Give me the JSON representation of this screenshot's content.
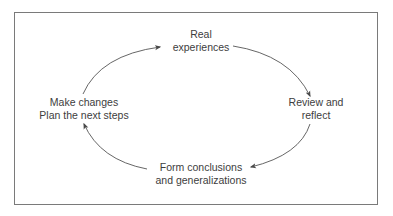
{
  "diagram": {
    "type": "cycle",
    "nodes": [
      {
        "id": "top",
        "lines": [
          "Real",
          "experiences"
        ]
      },
      {
        "id": "right",
        "lines": [
          "Review and",
          "reflect"
        ]
      },
      {
        "id": "bottom",
        "lines": [
          "Form conclusions",
          "and generalizations"
        ]
      },
      {
        "id": "left",
        "lines": [
          "Make changes",
          "Plan the next steps"
        ]
      }
    ],
    "edges": [
      {
        "from": "top",
        "to": "right"
      },
      {
        "from": "right",
        "to": "bottom"
      },
      {
        "from": "bottom",
        "to": "left"
      },
      {
        "from": "left",
        "to": "top"
      }
    ],
    "colors": {
      "border": "#7a7a7a",
      "arrow": "#4a4a4a",
      "text": "#3d3d3d",
      "background": "#ffffff"
    }
  }
}
